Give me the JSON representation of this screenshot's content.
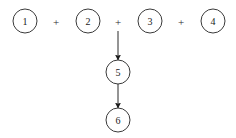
{
  "canvas": {
    "width": 236,
    "height": 138,
    "background": "#ffffff",
    "stroke_color": "#3a3a3a",
    "text_color": "#1a1a1a",
    "arrow_color": "#1c1c1c"
  },
  "diagram": {
    "type": "flow-diagram",
    "nodes": [
      {
        "id": "node-1",
        "label": "1",
        "cx": 25,
        "cy": 21,
        "r": 12
      },
      {
        "id": "node-2",
        "label": "2",
        "cx": 88,
        "cy": 21,
        "r": 12
      },
      {
        "id": "node-3",
        "label": "3",
        "cx": 150,
        "cy": 21,
        "r": 12
      },
      {
        "id": "node-4",
        "label": "4",
        "cx": 213,
        "cy": 21,
        "r": 12
      },
      {
        "id": "node-5",
        "label": "5",
        "cx": 118,
        "cy": 72,
        "r": 12
      },
      {
        "id": "node-6",
        "label": "6",
        "cx": 118,
        "cy": 120,
        "r": 12
      }
    ],
    "operators": [
      {
        "id": "plus-1",
        "label": "+",
        "cx": 56,
        "cy": 21
      },
      {
        "id": "plus-2",
        "label": "+",
        "cx": 118,
        "cy": 21
      },
      {
        "id": "plus-3",
        "label": "+",
        "cx": 181,
        "cy": 21
      }
    ],
    "edges": [
      {
        "id": "edge-sum-to-5",
        "from": "plus-2",
        "to": "node-5",
        "x": 118,
        "y1": 31,
        "y2": 60,
        "directed": true
      },
      {
        "id": "edge-5-to-6",
        "from": "node-5",
        "to": "node-6",
        "x": 118,
        "y1": 84,
        "y2": 108,
        "directed": true
      }
    ]
  }
}
